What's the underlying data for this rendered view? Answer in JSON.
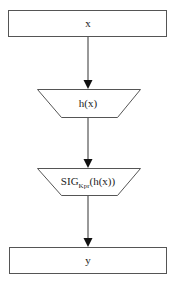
{
  "diagram": {
    "type": "flowchart",
    "nodes": [
      {
        "id": "input",
        "shape": "rectangle",
        "label": "x"
      },
      {
        "id": "hash",
        "shape": "trapezoid-inverted",
        "label": "h(x)"
      },
      {
        "id": "sign",
        "shape": "trapezoid-inverted",
        "label_main": "SIG",
        "label_sub": "Kpr",
        "label_tail": "(h(x))"
      },
      {
        "id": "output",
        "shape": "rectangle",
        "label": "y"
      }
    ],
    "edges": [
      {
        "from": "input",
        "to": "hash"
      },
      {
        "from": "hash",
        "to": "sign"
      },
      {
        "from": "sign",
        "to": "output"
      }
    ]
  }
}
